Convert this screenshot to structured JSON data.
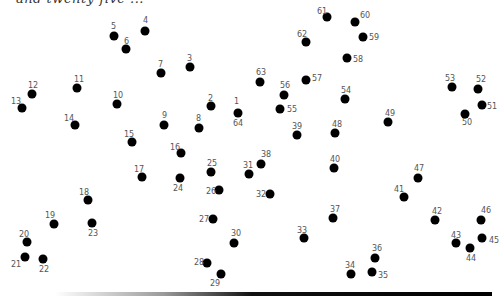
{
  "caption": "and twenty-five ...",
  "points": [
    {
      "n": "1",
      "x": 238,
      "y": 113,
      "lx": 234,
      "ly": 98
    },
    {
      "n": "64",
      "x": 238,
      "y": 113,
      "lx": 233,
      "ly": 120
    },
    {
      "n": "2",
      "x": 211,
      "y": 106,
      "lx": 208,
      "ly": 95
    },
    {
      "n": "3",
      "x": 190,
      "y": 67,
      "lx": 187,
      "ly": 55
    },
    {
      "n": "4",
      "x": 145,
      "y": 31,
      "lx": 143,
      "ly": 17
    },
    {
      "n": "5",
      "x": 114,
      "y": 36,
      "lx": 111,
      "ly": 23
    },
    {
      "n": "6",
      "x": 126,
      "y": 49,
      "lx": 124,
      "ly": 38
    },
    {
      "n": "7",
      "x": 161,
      "y": 73,
      "lx": 158,
      "ly": 61
    },
    {
      "n": "8",
      "x": 199,
      "y": 128,
      "lx": 196,
      "ly": 115
    },
    {
      "n": "9",
      "x": 164,
      "y": 125,
      "lx": 162,
      "ly": 112
    },
    {
      "n": "10",
      "x": 117,
      "y": 104,
      "lx": 113,
      "ly": 92
    },
    {
      "n": "11",
      "x": 77,
      "y": 88,
      "lx": 74,
      "ly": 76
    },
    {
      "n": "12",
      "x": 32,
      "y": 94,
      "lx": 28,
      "ly": 82
    },
    {
      "n": "13",
      "x": 22,
      "y": 108,
      "lx": 11,
      "ly": 98
    },
    {
      "n": "14",
      "x": 75,
      "y": 125,
      "lx": 64,
      "ly": 115
    },
    {
      "n": "15",
      "x": 132,
      "y": 142,
      "lx": 124,
      "ly": 131
    },
    {
      "n": "16",
      "x": 181,
      "y": 153,
      "lx": 170,
      "ly": 144
    },
    {
      "n": "17",
      "x": 142,
      "y": 177,
      "lx": 134,
      "ly": 166
    },
    {
      "n": "18",
      "x": 88,
      "y": 200,
      "lx": 79,
      "ly": 189
    },
    {
      "n": "19",
      "x": 54,
      "y": 224,
      "lx": 45,
      "ly": 212
    },
    {
      "n": "20",
      "x": 27,
      "y": 242,
      "lx": 19,
      "ly": 231
    },
    {
      "n": "21",
      "x": 25,
      "y": 257,
      "lx": 11,
      "ly": 261
    },
    {
      "n": "22",
      "x": 43,
      "y": 259,
      "lx": 39,
      "ly": 266
    },
    {
      "n": "23",
      "x": 92,
      "y": 223,
      "lx": 88,
      "ly": 230
    },
    {
      "n": "24",
      "x": 180,
      "y": 178,
      "lx": 173,
      "ly": 185
    },
    {
      "n": "25",
      "x": 211,
      "y": 172,
      "lx": 207,
      "ly": 160
    },
    {
      "n": "26",
      "x": 219,
      "y": 190,
      "lx": 206,
      "ly": 188
    },
    {
      "n": "27",
      "x": 213,
      "y": 219,
      "lx": 199,
      "ly": 216
    },
    {
      "n": "28",
      "x": 207,
      "y": 263,
      "lx": 194,
      "ly": 259
    },
    {
      "n": "29",
      "x": 221,
      "y": 274,
      "lx": 210,
      "ly": 280
    },
    {
      "n": "30",
      "x": 234,
      "y": 243,
      "lx": 231,
      "ly": 230
    },
    {
      "n": "31",
      "x": 249,
      "y": 174,
      "lx": 243,
      "ly": 162
    },
    {
      "n": "32",
      "x": 270,
      "y": 194,
      "lx": 256,
      "ly": 191
    },
    {
      "n": "33",
      "x": 304,
      "y": 238,
      "lx": 297,
      "ly": 227
    },
    {
      "n": "34",
      "x": 351,
      "y": 274,
      "lx": 345,
      "ly": 262
    },
    {
      "n": "35",
      "x": 372,
      "y": 272,
      "lx": 378,
      "ly": 272
    },
    {
      "n": "36",
      "x": 375,
      "y": 258,
      "lx": 372,
      "ly": 245
    },
    {
      "n": "37",
      "x": 333,
      "y": 218,
      "lx": 330,
      "ly": 206
    },
    {
      "n": "38",
      "x": 261,
      "y": 164,
      "lx": 261,
      "ly": 151
    },
    {
      "n": "39",
      "x": 297,
      "y": 135,
      "lx": 292,
      "ly": 123
    },
    {
      "n": "40",
      "x": 334,
      "y": 168,
      "lx": 330,
      "ly": 156
    },
    {
      "n": "41",
      "x": 404,
      "y": 197,
      "lx": 394,
      "ly": 186
    },
    {
      "n": "42",
      "x": 435,
      "y": 220,
      "lx": 432,
      "ly": 208
    },
    {
      "n": "43",
      "x": 456,
      "y": 243,
      "lx": 451,
      "ly": 232
    },
    {
      "n": "44",
      "x": 470,
      "y": 248,
      "lx": 466,
      "ly": 255
    },
    {
      "n": "45",
      "x": 482,
      "y": 238,
      "lx": 489,
      "ly": 237
    },
    {
      "n": "46",
      "x": 481,
      "y": 220,
      "lx": 481,
      "ly": 207
    },
    {
      "n": "47",
      "x": 418,
      "y": 178,
      "lx": 414,
      "ly": 165
    },
    {
      "n": "48",
      "x": 335,
      "y": 133,
      "lx": 332,
      "ly": 121
    },
    {
      "n": "49",
      "x": 388,
      "y": 122,
      "lx": 385,
      "ly": 110
    },
    {
      "n": "50",
      "x": 465,
      "y": 114,
      "lx": 462,
      "ly": 119
    },
    {
      "n": "51",
      "x": 482,
      "y": 105,
      "lx": 487,
      "ly": 103
    },
    {
      "n": "52",
      "x": 478,
      "y": 89,
      "lx": 476,
      "ly": 76
    },
    {
      "n": "53",
      "x": 452,
      "y": 87,
      "lx": 445,
      "ly": 75
    },
    {
      "n": "54",
      "x": 345,
      "y": 99,
      "lx": 341,
      "ly": 87
    },
    {
      "n": "55",
      "x": 280,
      "y": 109,
      "lx": 287,
      "ly": 106
    },
    {
      "n": "56",
      "x": 284,
      "y": 95,
      "lx": 280,
      "ly": 82
    },
    {
      "n": "57",
      "x": 306,
      "y": 80,
      "lx": 312,
      "ly": 75
    },
    {
      "n": "58",
      "x": 347,
      "y": 58,
      "lx": 353,
      "ly": 56
    },
    {
      "n": "59",
      "x": 363,
      "y": 37,
      "lx": 369,
      "ly": 34
    },
    {
      "n": "60",
      "x": 355,
      "y": 22,
      "lx": 360,
      "ly": 12
    },
    {
      "n": "61",
      "x": 327,
      "y": 17,
      "lx": 317,
      "ly": 8
    },
    {
      "n": "62",
      "x": 306,
      "y": 42,
      "lx": 297,
      "ly": 31
    },
    {
      "n": "63",
      "x": 260,
      "y": 82,
      "lx": 256,
      "ly": 69
    }
  ]
}
